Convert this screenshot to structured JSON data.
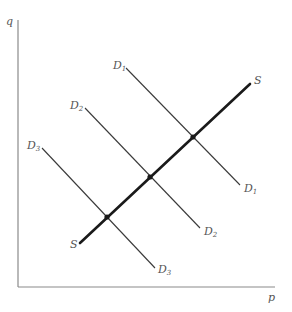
{
  "diagram": {
    "type": "supply-demand",
    "axes": {
      "y_label": "q",
      "x_label": "p"
    },
    "supply": {
      "label_start": "S",
      "label_end": "S"
    },
    "demand_curves": [
      {
        "label_start": "D",
        "sub_start": "1",
        "label_end": "D",
        "sub_end": "1"
      },
      {
        "label_start": "D",
        "sub_start": "2",
        "label_end": "D",
        "sub_end": "2"
      },
      {
        "label_start": "D",
        "sub_start": "3",
        "label_end": "D",
        "sub_end": "3"
      }
    ],
    "equilibrium_points": 3,
    "colors": {
      "axis": "#8a8a8a",
      "demand": "#3a3a3a",
      "supply": "#1a1a1a",
      "labels": "#555555"
    }
  }
}
